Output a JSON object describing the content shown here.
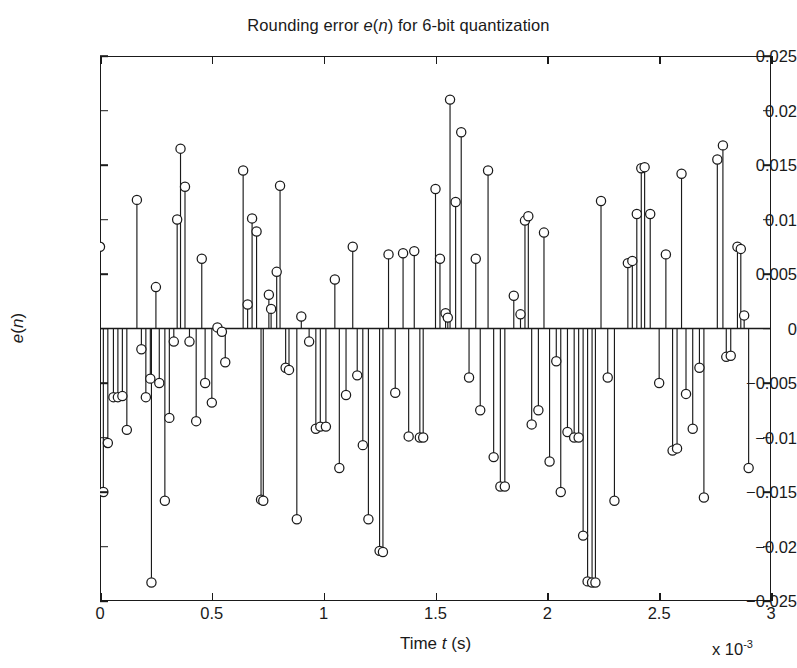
{
  "chart_data": {
    "type": "stem",
    "title": "Rounding error e(n) for 6-bit quantization",
    "title_parts": {
      "pre": "Rounding error ",
      "italic": "e",
      "mid": "(",
      "italic2": "n",
      "post": ") for 6-bit quantization"
    },
    "xlabel": "Time t (s)",
    "xlabel_parts": {
      "pre": "Time ",
      "italic": "t",
      "post": " (s)"
    },
    "ylabel": "e(n)",
    "x_exponent_label": "x 10",
    "x_exponent_value": "-3",
    "x_multiplier": 0.001,
    "xlim": [
      0,
      3
    ],
    "ylim": [
      -0.025,
      0.025
    ],
    "xticks": [
      "0",
      "0.5",
      "1",
      "1.5",
      "2",
      "2.5",
      "3"
    ],
    "xtick_values": [
      0,
      0.5,
      1,
      1.5,
      2,
      2.5,
      3
    ],
    "yticks": [
      "0.025",
      "0.02",
      "0.015",
      "0.01",
      "0.005",
      "0",
      "-0.005",
      "-0.01",
      "-0.015",
      "-0.02",
      "-0.025"
    ],
    "ytick_values": [
      0.025,
      0.02,
      0.015,
      0.01,
      0.005,
      0,
      -0.005,
      -0.01,
      -0.015,
      -0.02,
      -0.025
    ],
    "grid": false,
    "legend": null,
    "marker": "circle-open",
    "line_color": "#1a1a1a",
    "marker_color": "#1a1a1a",
    "baseline": 0,
    "n_points": 100,
    "x": [
      0.0,
      0.03,
      0.06,
      0.09,
      0.12,
      0.15,
      0.18,
      0.21,
      0.24,
      0.27,
      0.3,
      0.33,
      0.36,
      0.39,
      0.42,
      0.45,
      0.48,
      0.51,
      0.54,
      0.57,
      0.6,
      0.63,
      0.66,
      0.69,
      0.72,
      0.75,
      0.78,
      0.81,
      0.84,
      0.87,
      0.9,
      0.93,
      0.96,
      0.99,
      1.02,
      1.05,
      1.08,
      1.11,
      1.14,
      1.17,
      1.2,
      1.23,
      1.26,
      1.29,
      1.32,
      1.35,
      1.38,
      1.41,
      1.44,
      1.47,
      1.5,
      1.53,
      1.56,
      1.59,
      1.62,
      1.65,
      1.68,
      1.71,
      1.74,
      1.77,
      1.8,
      1.83,
      1.86,
      1.89,
      1.92,
      1.95,
      1.98,
      2.01,
      2.04,
      2.07,
      2.1,
      2.13,
      2.16,
      2.19,
      2.22,
      2.25,
      2.28,
      2.31,
      2.34,
      2.37,
      2.4,
      2.43,
      2.46,
      2.49,
      2.52,
      2.55,
      2.58,
      2.61,
      2.64,
      2.67,
      2.7,
      2.73,
      2.76,
      2.79,
      2.82,
      2.85,
      2.88,
      2.91,
      2.94,
      2.97
    ],
    "values": [
      0.0075,
      -0.015,
      -0.0105,
      -0.0063,
      -0.0063,
      -0.0062,
      -0.0093,
      0.0118,
      -0.0019,
      -0.0037,
      -0.0046,
      -0.0233,
      -0.0063,
      -0.0158,
      -0.0082,
      -0.0012,
      0.01,
      0.0165,
      -0.005,
      -0.0012,
      0.013,
      0.0064,
      -0.0143,
      -0.0043,
      -0.0068,
      0.0001,
      0.0145,
      0.0089,
      -0.0002,
      -0.0158,
      -0.0157,
      0.0022,
      -0.003,
      0.0052,
      0.0032,
      0.0131,
      -0.0022,
      -0.0143,
      -0.0143,
      -0.0078,
      -0.0036,
      -0.0175,
      0.0031,
      0.0018,
      -0.0119,
      0.0031,
      -0.006,
      0.005,
      -0.0128,
      0.0044,
      -0.0002,
      -0.0035,
      -0.0105,
      -0.009,
      -0.009,
      0.0075,
      -0.0015,
      -0.0087,
      -0.003,
      -0.0063,
      -0.0045,
      -0.013,
      -0.0016,
      -0.0094,
      -0.0204,
      -0.0204,
      0.0068,
      0.001,
      0.0014,
      0.0068,
      -0.006,
      -0.01,
      -0.01,
      0.0071,
      -0.0068,
      0.0128,
      0.0064,
      0.0116,
      0.021,
      -0.0045,
      0.018,
      -0.0075,
      0.0145,
      -0.0118,
      -0.001,
      0.003,
      -0.0145,
      -0.0145,
      0.0052,
      -0.0037,
      0.0099,
      0.0103,
      -0.0075,
      -0.0122,
      0.0013,
      0.0088,
      -0.015,
      -0.0036,
      -0.0192,
      -0.0026
    ],
    "series_full": [
      {
        "x": 0.0,
        "y": 0.0075
      },
      {
        "x": 0.015,
        "y": -0.015
      },
      {
        "x": 0.035,
        "y": -0.0105
      },
      {
        "x": 0.06,
        "y": -0.0063
      },
      {
        "x": 0.08,
        "y": -0.0063
      },
      {
        "x": 0.1,
        "y": -0.0062
      },
      {
        "x": 0.12,
        "y": -0.0093
      },
      {
        "x": 0.165,
        "y": 0.0118
      },
      {
        "x": 0.185,
        "y": -0.0019
      },
      {
        "x": 0.205,
        "y": -0.0063
      },
      {
        "x": 0.225,
        "y": -0.0046
      },
      {
        "x": 0.23,
        "y": -0.0233
      },
      {
        "x": 0.25,
        "y": 0.0038
      },
      {
        "x": 0.265,
        "y": -0.005
      },
      {
        "x": 0.29,
        "y": -0.0158
      },
      {
        "x": 0.31,
        "y": -0.0082
      },
      {
        "x": 0.33,
        "y": -0.0012
      },
      {
        "x": 0.345,
        "y": 0.01
      },
      {
        "x": 0.36,
        "y": 0.0165
      },
      {
        "x": 0.38,
        "y": 0.013
      },
      {
        "x": 0.4,
        "y": -0.0012
      },
      {
        "x": 0.43,
        "y": -0.0085
      },
      {
        "x": 0.455,
        "y": 0.0064
      },
      {
        "x": 0.47,
        "y": -0.005
      },
      {
        "x": 0.5,
        "y": -0.0068
      },
      {
        "x": 0.525,
        "y": 0.0001
      },
      {
        "x": 0.545,
        "y": -0.0003
      },
      {
        "x": 0.56,
        "y": -0.0031
      },
      {
        "x": 0.64,
        "y": 0.0145
      },
      {
        "x": 0.66,
        "y": 0.0022
      },
      {
        "x": 0.68,
        "y": 0.0101
      },
      {
        "x": 0.7,
        "y": 0.0089
      },
      {
        "x": 0.72,
        "y": -0.0157
      },
      {
        "x": 0.73,
        "y": -0.0158
      },
      {
        "x": 0.755,
        "y": 0.0031
      },
      {
        "x": 0.765,
        "y": 0.0018
      },
      {
        "x": 0.79,
        "y": 0.0052
      },
      {
        "x": 0.805,
        "y": 0.0131
      },
      {
        "x": 0.83,
        "y": -0.0036
      },
      {
        "x": 0.845,
        "y": -0.0038
      },
      {
        "x": 0.88,
        "y": -0.0175
      },
      {
        "x": 0.9,
        "y": 0.0011
      },
      {
        "x": 0.935,
        "y": -0.0012
      },
      {
        "x": 0.965,
        "y": -0.0092
      },
      {
        "x": 0.985,
        "y": -0.009
      },
      {
        "x": 1.01,
        "y": -0.009
      },
      {
        "x": 1.05,
        "y": 0.0045
      },
      {
        "x": 1.07,
        "y": -0.0128
      },
      {
        "x": 1.1,
        "y": -0.0061
      },
      {
        "x": 1.13,
        "y": 0.0075
      },
      {
        "x": 1.15,
        "y": -0.0043
      },
      {
        "x": 1.175,
        "y": -0.0107
      },
      {
        "x": 1.2,
        "y": -0.0175
      },
      {
        "x": 1.25,
        "y": -0.0204
      },
      {
        "x": 1.265,
        "y": -0.0205
      },
      {
        "x": 1.29,
        "y": 0.0068
      },
      {
        "x": 1.32,
        "y": -0.0059
      },
      {
        "x": 1.355,
        "y": 0.0069
      },
      {
        "x": 1.38,
        "y": -0.0099
      },
      {
        "x": 1.405,
        "y": 0.0071
      },
      {
        "x": 1.43,
        "y": -0.01
      },
      {
        "x": 1.445,
        "y": -0.01
      },
      {
        "x": 1.5,
        "y": 0.0128
      },
      {
        "x": 1.52,
        "y": 0.0064
      },
      {
        "x": 1.545,
        "y": 0.0014
      },
      {
        "x": 1.555,
        "y": 0.001
      },
      {
        "x": 1.565,
        "y": 0.021
      },
      {
        "x": 1.59,
        "y": 0.0116
      },
      {
        "x": 1.615,
        "y": 0.018
      },
      {
        "x": 1.65,
        "y": -0.0045
      },
      {
        "x": 1.68,
        "y": 0.0064
      },
      {
        "x": 1.7,
        "y": -0.0075
      },
      {
        "x": 1.735,
        "y": 0.0145
      },
      {
        "x": 1.76,
        "y": -0.0118
      },
      {
        "x": 1.79,
        "y": -0.0145
      },
      {
        "x": 1.81,
        "y": -0.0145
      },
      {
        "x": 1.85,
        "y": 0.003
      },
      {
        "x": 1.88,
        "y": 0.0013
      },
      {
        "x": 1.9,
        "y": 0.0099
      },
      {
        "x": 1.915,
        "y": 0.0103
      },
      {
        "x": 1.93,
        "y": -0.0088
      },
      {
        "x": 1.96,
        "y": -0.0075
      },
      {
        "x": 1.985,
        "y": 0.0088
      },
      {
        "x": 2.01,
        "y": -0.0122
      },
      {
        "x": 2.04,
        "y": -0.003
      },
      {
        "x": 2.06,
        "y": -0.015
      },
      {
        "x": 2.09,
        "y": -0.0095
      },
      {
        "x": 2.12,
        "y": -0.01
      },
      {
        "x": 2.14,
        "y": -0.01
      },
      {
        "x": 2.16,
        "y": -0.019
      },
      {
        "x": 2.18,
        "y": -0.0232
      },
      {
        "x": 2.2,
        "y": -0.0233
      },
      {
        "x": 2.215,
        "y": -0.0233
      },
      {
        "x": 2.24,
        "y": 0.0117
      },
      {
        "x": 2.27,
        "y": -0.0045
      },
      {
        "x": 2.3,
        "y": -0.0158
      },
      {
        "x": 2.36,
        "y": 0.006
      },
      {
        "x": 2.38,
        "y": 0.0062
      },
      {
        "x": 2.4,
        "y": 0.0105
      },
      {
        "x": 2.42,
        "y": 0.0147
      },
      {
        "x": 2.435,
        "y": 0.0148
      },
      {
        "x": 2.46,
        "y": 0.0105
      },
      {
        "x": 2.5,
        "y": -0.005
      },
      {
        "x": 2.53,
        "y": 0.0068
      },
      {
        "x": 2.56,
        "y": -0.0112
      },
      {
        "x": 2.58,
        "y": -0.011
      },
      {
        "x": 2.6,
        "y": 0.0142
      },
      {
        "x": 2.62,
        "y": -0.006
      },
      {
        "x": 2.65,
        "y": -0.0092
      },
      {
        "x": 2.68,
        "y": -0.0036
      },
      {
        "x": 2.7,
        "y": -0.0155
      },
      {
        "x": 2.76,
        "y": 0.0155
      },
      {
        "x": 2.785,
        "y": 0.0168
      },
      {
        "x": 2.8,
        "y": -0.0026
      },
      {
        "x": 2.82,
        "y": -0.0025
      },
      {
        "x": 2.85,
        "y": 0.0075
      },
      {
        "x": 2.865,
        "y": 0.0073
      },
      {
        "x": 2.88,
        "y": 0.0012
      },
      {
        "x": 2.9,
        "y": -0.0128
      }
    ]
  }
}
